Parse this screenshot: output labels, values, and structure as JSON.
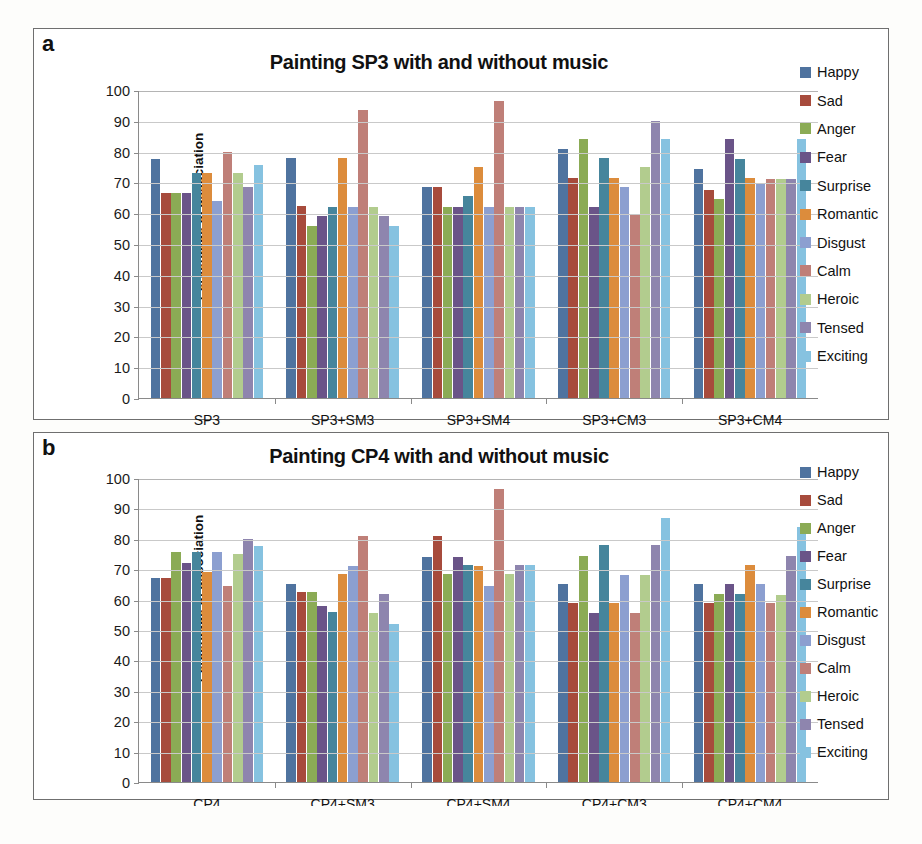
{
  "panels": [
    {
      "letter": "a",
      "title": "Painting SP3 with and without music",
      "ylabel": "Percentage of association"
    },
    {
      "letter": "b",
      "title": "Painting CP4 with and without music",
      "ylabel": "Percentage of association"
    }
  ],
  "legend": {
    "labels": [
      "Happy",
      "Sad",
      "Anger",
      "Fear",
      "Surprise",
      "Romantic",
      "Disgust",
      "Calm",
      "Heroic",
      "Tensed",
      "Exciting"
    ],
    "colors": [
      "#4f739f",
      "#a74b3c",
      "#8bab55",
      "#6a5488",
      "#46859c",
      "#dc8c3c",
      "#8c9fd0",
      "#bf7f78",
      "#b2cc8e",
      "#8e85ae",
      "#86c2e0"
    ]
  },
  "yticks": [
    "0",
    "10",
    "20",
    "30",
    "40",
    "50",
    "60",
    "70",
    "80",
    "90",
    "100"
  ],
  "chart_data": [
    {
      "type": "bar",
      "title": "Painting SP3 with and without music",
      "panel": "a",
      "xlabel": "",
      "ylabel": "Percentage of association",
      "ylim": [
        0,
        100
      ],
      "ytick_step": 10,
      "grid": true,
      "legend_position": "right",
      "categories": [
        "SP3",
        "SP3+SM3",
        "SP3+SM4",
        "SP3+CM3",
        "SP3+CM4"
      ],
      "series": [
        {
          "name": "Happy",
          "values": [
            77.5,
            78.0,
            68.5,
            81.0,
            74.5
          ]
        },
        {
          "name": "Sad",
          "values": [
            66.5,
            62.5,
            68.5,
            71.5,
            67.5
          ]
        },
        {
          "name": "Anger",
          "values": [
            66.5,
            56.0,
            62.0,
            84.0,
            64.5
          ]
        },
        {
          "name": "Fear",
          "values": [
            66.5,
            59.0,
            62.0,
            62.0,
            84.0
          ]
        },
        {
          "name": "Surprise",
          "values": [
            73.0,
            62.0,
            65.5,
            78.0,
            77.5
          ]
        },
        {
          "name": "Romantic",
          "values": [
            73.0,
            78.0,
            75.0,
            71.5,
            71.5
          ]
        },
        {
          "name": "Disgust",
          "values": [
            64.0,
            62.0,
            62.0,
            68.5,
            69.5
          ]
        },
        {
          "name": "Calm",
          "values": [
            80.0,
            93.5,
            96.5,
            59.5,
            71.0
          ]
        },
        {
          "name": "Heroic",
          "values": [
            73.0,
            62.0,
            62.0,
            75.0,
            71.0
          ]
        },
        {
          "name": "Tensed",
          "values": [
            68.5,
            59.0,
            62.0,
            90.0,
            71.0
          ]
        },
        {
          "name": "Exciting",
          "values": [
            75.5,
            56.0,
            62.0,
            84.0,
            84.0
          ]
        }
      ]
    },
    {
      "type": "bar",
      "title": "Painting CP4 with and without music",
      "panel": "b",
      "xlabel": "",
      "ylabel": "Percentage of association",
      "ylim": [
        0,
        100
      ],
      "ytick_step": 10,
      "grid": true,
      "legend_position": "right",
      "categories": [
        "CP4",
        "CP4+SM3",
        "CP4+SM4",
        "CP4+CM3",
        "CP4+CM4"
      ],
      "series": [
        {
          "name": "Happy",
          "values": [
            67.0,
            65.0,
            74.0,
            65.0,
            65.0
          ]
        },
        {
          "name": "Sad",
          "values": [
            67.0,
            62.5,
            81.0,
            59.0,
            59.0
          ]
        },
        {
          "name": "Anger",
          "values": [
            75.5,
            62.5,
            68.5,
            74.5,
            62.0
          ]
        },
        {
          "name": "Fear",
          "values": [
            72.0,
            58.0,
            74.0,
            55.5,
            65.0
          ]
        },
        {
          "name": "Surprise",
          "values": [
            75.5,
            56.0,
            71.5,
            78.0,
            62.0
          ]
        },
        {
          "name": "Romantic",
          "values": [
            69.0,
            68.5,
            71.0,
            59.0,
            71.5
          ]
        },
        {
          "name": "Disgust",
          "values": [
            75.5,
            71.0,
            64.5,
            68.0,
            65.0
          ]
        },
        {
          "name": "Calm",
          "values": [
            64.5,
            81.0,
            96.5,
            55.5,
            59.0
          ]
        },
        {
          "name": "Heroic",
          "values": [
            75.0,
            55.5,
            68.5,
            68.0,
            61.5
          ]
        },
        {
          "name": "Tensed",
          "values": [
            80.0,
            62.0,
            71.5,
            78.0,
            74.5
          ]
        },
        {
          "name": "Exciting",
          "values": [
            77.5,
            52.0,
            71.5,
            87.0,
            84.0
          ]
        }
      ]
    }
  ]
}
